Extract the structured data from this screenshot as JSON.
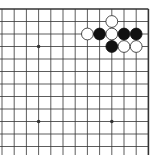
{
  "board": {
    "size": 19,
    "visible_cols": [
      7,
      8,
      9,
      10,
      11,
      12,
      13,
      14,
      15,
      16,
      17,
      18,
      19
    ],
    "visible_rows": [
      1,
      2,
      3,
      4,
      5,
      6,
      7,
      8,
      9,
      10,
      11,
      12,
      13
    ],
    "star_points": [
      [
        10,
        4
      ],
      [
        16,
        4
      ],
      [
        10,
        10
      ],
      [
        16,
        10
      ]
    ],
    "stones": [
      {
        "color": "white",
        "col": 16,
        "row": 2
      },
      {
        "color": "white",
        "col": 14,
        "row": 3
      },
      {
        "color": "black",
        "col": 15,
        "row": 3
      },
      {
        "color": "white",
        "col": 16,
        "row": 3
      },
      {
        "color": "black",
        "col": 17,
        "row": 3
      },
      {
        "color": "black",
        "col": 18,
        "row": 3
      },
      {
        "color": "black",
        "col": 16,
        "row": 4
      },
      {
        "color": "white",
        "col": 17,
        "row": 4
      },
      {
        "color": "white",
        "col": 18,
        "row": 4
      }
    ]
  },
  "colors": {
    "line": "#333333",
    "black_stone": "#111111",
    "white_stone": "#ffffff",
    "white_outline": "#222222",
    "background": "#ffffff"
  }
}
